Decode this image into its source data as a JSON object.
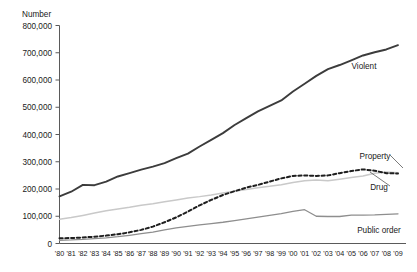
{
  "chart_data": {
    "type": "line",
    "title": "",
    "subtitle": "",
    "ylabel": "Number",
    "xlabel": "",
    "ylim": [
      0,
      800000
    ],
    "xlim": [
      "'80",
      "'09"
    ],
    "grid": false,
    "legend_position": "inline-right-labels",
    "yticks": [
      0,
      100000,
      200000,
      300000,
      400000,
      500000,
      600000,
      700000,
      800000
    ],
    "ytick_labels": [
      "0",
      "100,000",
      "200,000",
      "300,000",
      "400,000",
      "500,000",
      "600,000",
      "700,000",
      "800,000"
    ],
    "categories": [
      "'80",
      "'81",
      "'82",
      "'83",
      "'84",
      "'85",
      "'86",
      "'87",
      "'88",
      "'89",
      "'90",
      "'91",
      "'92",
      "'93",
      "'94",
      "'95",
      "'96",
      "'97",
      "'98",
      "'99",
      "'00",
      "'01",
      "'02",
      "'03",
      "'04",
      "'05",
      "'06",
      "'07",
      "'08",
      "'09"
    ],
    "series": [
      {
        "name": "Violent",
        "style": "solid",
        "color": "#3c3c3c",
        "width": 1.9,
        "label_anchor": {
          "x": "'04",
          "y": 630000
        },
        "values": [
          173000,
          190000,
          215000,
          214000,
          227000,
          246000,
          258000,
          271000,
          282000,
          295000,
          313000,
          330000,
          356000,
          380000,
          405000,
          435000,
          460000,
          485000,
          505000,
          525000,
          558000,
          586000,
          615000,
          640000,
          655000,
          672000,
          690000,
          702000,
          712000,
          728000
        ]
      },
      {
        "name": "Property",
        "style": "solid",
        "color": "#c9c9c9",
        "width": 1.5,
        "label_anchor": {
          "x": "'08",
          "y": 310000
        },
        "values": [
          89000,
          95000,
          103000,
          112000,
          120000,
          127000,
          133000,
          140000,
          146000,
          153000,
          160000,
          167000,
          172000,
          178000,
          185000,
          192000,
          198000,
          205000,
          210000,
          216000,
          224000,
          230000,
          233000,
          230000,
          236000,
          242000,
          248000,
          258000,
          262000,
          260000
        ]
      },
      {
        "name": "Drug",
        "style": "dashed",
        "color": "#1f1f1f",
        "width": 2.0,
        "label_anchor": {
          "x": "'08",
          "y": 205000
        },
        "values": [
          19000,
          20000,
          22000,
          25000,
          29000,
          34000,
          41000,
          50000,
          62000,
          78000,
          96000,
          117000,
          140000,
          160000,
          178000,
          192000,
          205000,
          215000,
          227000,
          239000,
          248000,
          250000,
          248000,
          250000,
          258000,
          266000,
          272000,
          267000,
          258000,
          257000
        ]
      },
      {
        "name": "Public order",
        "style": "solid",
        "color": "#8e8e8e",
        "width": 1.3,
        "label_anchor": {
          "x": "'08",
          "y": 62000
        },
        "values": [
          12000,
          13000,
          15000,
          18000,
          21000,
          25000,
          30000,
          36000,
          42000,
          50000,
          57000,
          63000,
          68000,
          73000,
          78000,
          84000,
          90000,
          97000,
          103000,
          110000,
          118000,
          124000,
          100000,
          99000,
          99000,
          104000,
          104000,
          105000,
          107000,
          109000
        ]
      }
    ]
  },
  "labels": {
    "violent": "Violent",
    "property": "Property",
    "drug": "Drug",
    "public_order": "Public order"
  }
}
